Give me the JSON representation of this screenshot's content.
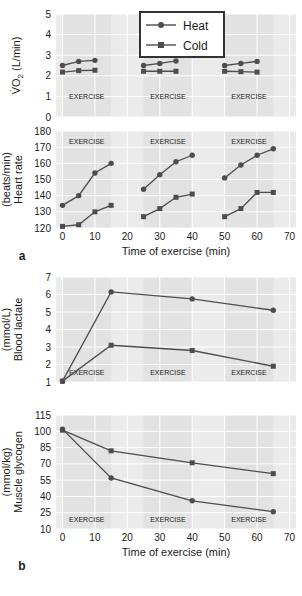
{
  "figure": {
    "width": 302,
    "height": 596,
    "background": "#ffffff",
    "panel_background": "#ebebeb",
    "gridline_color": "#ffffff",
    "series_color": "#4d4d4d",
    "band_label": "EXERCISE",
    "panel_letters": {
      "a": "a",
      "b": "b"
    }
  },
  "legend": {
    "position": "top-center-right",
    "entries": [
      {
        "label": "Heat",
        "marker": "circle",
        "color": "#4d4d4d"
      },
      {
        "label": "Cold",
        "marker": "square",
        "color": "#4d4d4d"
      }
    ]
  },
  "exercise_bands": [
    {
      "start": 0,
      "end": 15,
      "label": "EXERCISE"
    },
    {
      "start": 25,
      "end": 40,
      "label": "EXERCISE"
    },
    {
      "start": 50,
      "end": 65,
      "label": "EXERCISE"
    }
  ],
  "chart_data": [
    {
      "id": "vo2",
      "type": "line",
      "title": "",
      "xlabel": "",
      "ylabel": "V̇O₂ (L/min)",
      "ylabel_lines": [
        "V̇O2 (L/min)"
      ],
      "xlim": [
        -2,
        72
      ],
      "ylim": [
        0,
        5
      ],
      "yticks": [
        0,
        1,
        2,
        3,
        4,
        5
      ],
      "ytick_labels": [
        "0",
        "1",
        "2",
        "3",
        "4",
        "5"
      ],
      "xticks": [
        0,
        10,
        20,
        30,
        40,
        50,
        60,
        70
      ],
      "xtick_labels": [],
      "show_xtick_labels": false,
      "grid": true,
      "series": [
        {
          "name": "Heat",
          "marker": "circle",
          "x": [
            0,
            5,
            10,
            25,
            30,
            35,
            50,
            55,
            60
          ],
          "values": [
            2.5,
            2.7,
            2.75,
            2.5,
            2.6,
            2.72,
            2.5,
            2.6,
            2.7
          ]
        },
        {
          "name": "Cold",
          "marker": "square",
          "x": [
            0,
            5,
            10,
            25,
            30,
            35,
            50,
            55,
            60
          ],
          "values": [
            2.18,
            2.25,
            2.27,
            2.22,
            2.22,
            2.22,
            2.22,
            2.2,
            2.18
          ]
        }
      ],
      "segments": [
        [
          0,
          3
        ],
        [
          3,
          6
        ],
        [
          6,
          9
        ]
      ]
    },
    {
      "id": "heart_rate",
      "type": "line",
      "title": "",
      "xlabel": "Time of exercise (min)",
      "ylabel": "Heart rate (beats/min)",
      "ylabel_lines": [
        "Heart rate",
        "(beats/min)"
      ],
      "xlim": [
        -2,
        72
      ],
      "ylim": [
        120,
        180
      ],
      "yticks": [
        120,
        130,
        140,
        150,
        160,
        170,
        180
      ],
      "ytick_labels": [
        "120",
        "130",
        "140",
        "150",
        "160",
        "170",
        "180"
      ],
      "xticks": [
        0,
        10,
        20,
        30,
        40,
        50,
        60,
        70
      ],
      "xtick_labels": [
        "0",
        "10",
        "20",
        "30",
        "40",
        "50",
        "60",
        "70"
      ],
      "show_xtick_labels": true,
      "grid": true,
      "series": [
        {
          "name": "Heat",
          "marker": "circle",
          "x": [
            0,
            5,
            10,
            15,
            25,
            30,
            35,
            40,
            50,
            55,
            60,
            65
          ],
          "values": [
            134,
            140,
            154,
            160,
            144,
            153,
            161,
            165,
            151,
            159,
            165,
            169
          ]
        },
        {
          "name": "Cold",
          "marker": "square",
          "x": [
            0,
            5,
            10,
            15,
            25,
            30,
            35,
            40,
            50,
            55,
            60,
            65
          ],
          "values": [
            121,
            122,
            130,
            134,
            127,
            132,
            139,
            141,
            127,
            132,
            142,
            142
          ]
        }
      ],
      "segments": [
        [
          0,
          4
        ],
        [
          4,
          8
        ],
        [
          8,
          12
        ]
      ]
    },
    {
      "id": "blood_lactate",
      "type": "line",
      "title": "",
      "xlabel": "",
      "ylabel": "Blood lactate (mmol/L)",
      "ylabel_lines": [
        "Blood lactate",
        "(mmol/L)"
      ],
      "xlim": [
        -2,
        72
      ],
      "ylim": [
        1,
        7
      ],
      "yticks": [
        1,
        2,
        3,
        4,
        5,
        6,
        7
      ],
      "ytick_labels": [
        "1",
        "2",
        "3",
        "4",
        "5",
        "6",
        "7"
      ],
      "xticks": [
        0,
        10,
        20,
        30,
        40,
        50,
        60,
        70
      ],
      "xtick_labels": [],
      "show_xtick_labels": false,
      "grid": true,
      "series": [
        {
          "name": "Heat",
          "marker": "circle",
          "x": [
            0,
            15,
            40,
            65
          ],
          "values": [
            1.05,
            6.15,
            5.75,
            5.1
          ]
        },
        {
          "name": "Cold",
          "marker": "square",
          "x": [
            0,
            15,
            40,
            65
          ],
          "values": [
            1.05,
            3.1,
            2.8,
            1.9
          ]
        }
      ],
      "segments": [
        [
          0,
          4
        ]
      ]
    },
    {
      "id": "muscle_glycogen",
      "type": "line",
      "title": "",
      "xlabel": "Time of exercise (min)",
      "ylabel": "Muscle glycogen (mmol/kg)",
      "ylabel_lines": [
        "Muscle glycogen",
        "(mmol/kg)"
      ],
      "xlim": [
        -2,
        72
      ],
      "ylim": [
        10,
        115
      ],
      "yticks": [
        10,
        25,
        40,
        55,
        70,
        85,
        100,
        115
      ],
      "ytick_labels": [
        "10",
        "25",
        "40",
        "55",
        "70",
        "85",
        "100",
        "115"
      ],
      "xticks": [
        0,
        10,
        20,
        30,
        40,
        50,
        60,
        70
      ],
      "xtick_labels": [
        "0",
        "10",
        "20",
        "30",
        "40",
        "50",
        "60",
        "70"
      ],
      "show_xtick_labels": true,
      "grid": true,
      "series": [
        {
          "name": "Heat",
          "marker": "circle",
          "x": [
            0,
            15,
            40,
            65
          ],
          "values": [
            102,
            57,
            36,
            26
          ]
        },
        {
          "name": "Cold",
          "marker": "square",
          "x": [
            0,
            15,
            40,
            65
          ],
          "values": [
            101,
            82,
            71,
            61
          ]
        }
      ],
      "segments": [
        [
          0,
          4
        ]
      ]
    }
  ]
}
